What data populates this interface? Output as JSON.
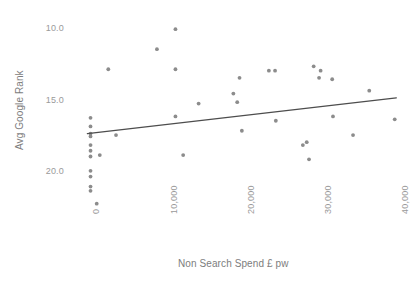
{
  "chart_data": {
    "type": "scatter",
    "title": "",
    "xlabel": "Non Search Spend £ pw",
    "ylabel": "Avg Google Rank",
    "xlim": [
      -2000,
      41000
    ],
    "ylim": [
      22.5,
      8.8
    ],
    "y_axis_inverted": true,
    "grid": false,
    "legend": "none",
    "xticks": [
      0,
      10000,
      20000,
      30000,
      40000
    ],
    "xtick_labels": [
      "0",
      "10,000",
      "20,000",
      "30,000",
      "40,000"
    ],
    "yticks": [
      10.0,
      15.0,
      20.0
    ],
    "ytick_labels": [
      "10.0",
      "15.0",
      "20.0"
    ],
    "point_color": "#8c8c8c",
    "trendline_color": "#4d4d4d",
    "axis_label_color": "#9a9a9a",
    "background_color": "#ffffff",
    "points": [
      {
        "x": 400,
        "y": 16.2
      },
      {
        "x": 400,
        "y": 16.8
      },
      {
        "x": 400,
        "y": 17.3
      },
      {
        "x": 400,
        "y": 17.5
      },
      {
        "x": 400,
        "y": 18.1
      },
      {
        "x": 400,
        "y": 18.5
      },
      {
        "x": 400,
        "y": 18.9
      },
      {
        "x": 400,
        "y": 19.9
      },
      {
        "x": 400,
        "y": 20.3
      },
      {
        "x": 400,
        "y": 21.0
      },
      {
        "x": 400,
        "y": 21.3
      },
      {
        "x": 1200,
        "y": 22.2
      },
      {
        "x": 1600,
        "y": 18.8
      },
      {
        "x": 2700,
        "y": 12.8
      },
      {
        "x": 3700,
        "y": 17.4
      },
      {
        "x": 9000,
        "y": 11.4
      },
      {
        "x": 11400,
        "y": 10.0
      },
      {
        "x": 11400,
        "y": 12.8
      },
      {
        "x": 11400,
        "y": 16.1
      },
      {
        "x": 12400,
        "y": 18.8
      },
      {
        "x": 14400,
        "y": 15.2
      },
      {
        "x": 18900,
        "y": 14.5
      },
      {
        "x": 19400,
        "y": 15.1
      },
      {
        "x": 19700,
        "y": 13.4
      },
      {
        "x": 20000,
        "y": 17.1
      },
      {
        "x": 23500,
        "y": 12.9
      },
      {
        "x": 24300,
        "y": 12.9
      },
      {
        "x": 24400,
        "y": 16.4
      },
      {
        "x": 27900,
        "y": 18.1
      },
      {
        "x": 28400,
        "y": 17.9
      },
      {
        "x": 28700,
        "y": 19.1
      },
      {
        "x": 29300,
        "y": 12.6
      },
      {
        "x": 30000,
        "y": 13.4
      },
      {
        "x": 30200,
        "y": 12.9
      },
      {
        "x": 31700,
        "y": 13.5
      },
      {
        "x": 31800,
        "y": 16.1
      },
      {
        "x": 34400,
        "y": 17.4
      },
      {
        "x": 36500,
        "y": 14.3
      },
      {
        "x": 39800,
        "y": 16.3
      }
    ],
    "trendline": {
      "label": "linear fit",
      "x_start": 0,
      "y_start": 17.3,
      "x_end": 40000,
      "y_end": 14.8
    }
  }
}
